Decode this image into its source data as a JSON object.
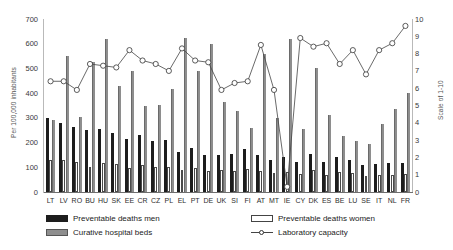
{
  "chart_data": {
    "type": "bar",
    "title": "",
    "xlabel": "",
    "ylabel": "Per 100,000 inhabitants",
    "y2label": "Scale of 1-10",
    "ylim": [
      0,
      700
    ],
    "y2lim": [
      0,
      10
    ],
    "grid": false,
    "legend_position": "bottom",
    "categories": [
      "LT",
      "LV",
      "RO",
      "BU",
      "HU",
      "SK",
      "EE",
      "CR",
      "CZ",
      "PL",
      "EL",
      "PT",
      "DE",
      "UK",
      "SI",
      "FI",
      "AT",
      "MT",
      "IE",
      "CY",
      "DK",
      "ES",
      "BE",
      "LU",
      "SE",
      "IT",
      "NL",
      "FR"
    ],
    "yticks": [
      0,
      100,
      200,
      300,
      400,
      500,
      600,
      700
    ],
    "y2ticks": [
      0,
      1,
      2,
      3,
      4,
      5,
      6,
      7,
      8,
      9,
      10
    ],
    "series": [
      {
        "name": "Preventable deaths men",
        "axis": "left",
        "color": "#1d1d1d",
        "values": [
          300,
          278,
          262,
          250,
          255,
          237,
          215,
          230,
          205,
          210,
          160,
          178,
          150,
          148,
          155,
          175,
          148,
          128,
          140,
          120,
          155,
          120,
          142,
          130,
          108,
          115,
          118,
          118
        ]
      },
      {
        "name": "Preventable deaths women",
        "axis": "left",
        "color": "#ffffff",
        "values": [
          130,
          128,
          122,
          100,
          118,
          112,
          98,
          108,
          100,
          102,
          88,
          96,
          86,
          88,
          85,
          92,
          84,
          78,
          82,
          72,
          88,
          70,
          80,
          76,
          66,
          70,
          70,
          72
        ]
      },
      {
        "name": "Curative hospital beds",
        "axis": "left",
        "color": "#8e8e8e",
        "values": [
          290,
          550,
          305,
          525,
          620,
          428,
          490,
          348,
          352,
          415,
          625,
          490,
          600,
          365,
          328,
          260,
          560,
          300,
          620,
          255,
          500,
          310,
          225,
          205,
          195,
          275,
          335,
          400
        ]
      },
      {
        "name": "Laboratory capacity",
        "axis": "right",
        "color": "#444444",
        "values": [
          6.4,
          6.4,
          5.9,
          7.4,
          7.3,
          7.2,
          8.2,
          7.6,
          7.4,
          7.0,
          8.3,
          7.6,
          7.5,
          5.9,
          6.3,
          6.4,
          8.5,
          5.9,
          0.3,
          8.9,
          8.4,
          8.6,
          7.4,
          8.2,
          6.8,
          8.2,
          8.6,
          9.6
        ]
      }
    ]
  },
  "legend": {
    "items": [
      {
        "label": "Preventable deaths men",
        "icon": "solid-dark-swatch"
      },
      {
        "label": "Preventable deaths women",
        "icon": "outline-white-swatch"
      },
      {
        "label": "Curative hospital beds",
        "icon": "solid-grey-swatch"
      },
      {
        "label": "Laboratory capacity",
        "icon": "line-with-circle-marker"
      }
    ]
  }
}
